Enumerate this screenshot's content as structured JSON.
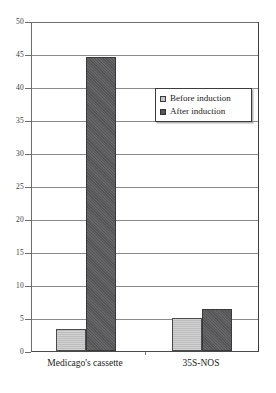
{
  "chart_data": {
    "type": "bar",
    "title": "",
    "subtitle": "",
    "xlabel": "",
    "ylabel": "",
    "categories": [
      "Medicago's cassette",
      "35S-NOS"
    ],
    "series": [
      {
        "name": "Before induction",
        "values": [
          3.3,
          5.0
        ],
        "color": "#bdbdbd"
      },
      {
        "name": "After induction",
        "values": [
          44.6,
          6.4
        ],
        "color": "#5a5a5c"
      }
    ],
    "ylim": [
      0,
      50
    ],
    "ytick_step": 5,
    "ytick_labels": [
      "50",
      "45",
      "40",
      "35",
      "30",
      "25",
      "20",
      "15",
      "10",
      "5",
      "0"
    ],
    "ytick_values": [
      50,
      45,
      40,
      35,
      30,
      25,
      20,
      15,
      10,
      5,
      0
    ],
    "grid": "horizontal",
    "legend_position": "inside-top-right",
    "bar_border_color": "#3a3a3a",
    "grid_color": "#8a8a8a",
    "axis_color": "#4a4a4a",
    "background": "#ffffff"
  },
  "axis": {
    "ticks": [
      {
        "label": "50",
        "value": 50
      },
      {
        "label": "45",
        "value": 45
      },
      {
        "label": "40",
        "value": 40
      },
      {
        "label": "35",
        "value": 35
      },
      {
        "label": "30",
        "value": 30
      },
      {
        "label": "25",
        "value": 25
      },
      {
        "label": "20",
        "value": 20
      },
      {
        "label": "15",
        "value": 15
      },
      {
        "label": "10",
        "value": 10
      },
      {
        "label": "5",
        "value": 5
      },
      {
        "label": "0",
        "value": 0
      }
    ]
  },
  "legend": {
    "items": [
      {
        "label": "Before induction",
        "swatch": "before"
      },
      {
        "label": "After induction",
        "swatch": "after"
      }
    ]
  },
  "categories": [
    {
      "label": "Medicago's cassette"
    },
    {
      "label": "35S-NOS"
    }
  ]
}
